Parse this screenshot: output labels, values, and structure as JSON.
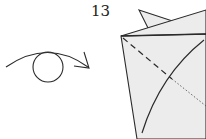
{
  "diagram": {
    "type": "origami-instruction",
    "step_number": "13",
    "symbols": [
      {
        "name": "turn-over-symbol",
        "meaning": "turn the model over",
        "shape": "circle with curved arrow"
      }
    ],
    "lines": [
      {
        "name": "valley-fold-line",
        "style": "dashed"
      },
      {
        "name": "hidden-edge-line",
        "style": "dotted"
      },
      {
        "name": "curved-edge",
        "style": "solid"
      }
    ],
    "colors": {
      "paper": "#ececec",
      "stroke": "#2a2a2a",
      "background": "#ffffff"
    }
  }
}
